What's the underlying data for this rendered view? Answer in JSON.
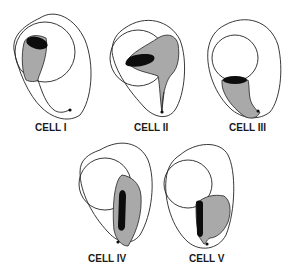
{
  "figure": {
    "type": "diagram",
    "colors": {
      "background": "#ffffff",
      "outline": "#222222",
      "shading": "#a9a9a9",
      "dark_body": "#0d0d0d"
    },
    "cells": [
      {
        "id": "cell-1",
        "label": "CELL I"
      },
      {
        "id": "cell-2",
        "label": "CELL II"
      },
      {
        "id": "cell-3",
        "label": "CELL III"
      },
      {
        "id": "cell-4",
        "label": "CELL IV"
      },
      {
        "id": "cell-5",
        "label": "CELL V"
      }
    ]
  }
}
